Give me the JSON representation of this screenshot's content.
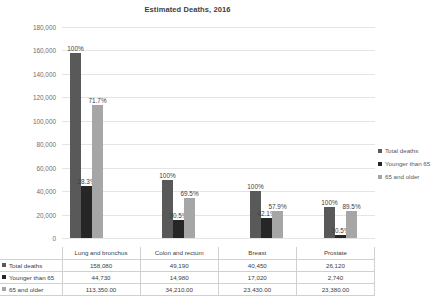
{
  "chart_data": {
    "type": "bar",
    "title": "Estimated Deaths, 2016",
    "xlabel": "",
    "ylabel": "",
    "ylim": [
      0,
      180000
    ],
    "ytick_step": 20000,
    "grid": true,
    "legend_position": "right",
    "categories": [
      "Lung and bronchus",
      "Colon and rectum",
      "Breast",
      "Prostate"
    ],
    "ytick_labels": [
      "0",
      "20,000",
      "40,000",
      "60,000",
      "80,000",
      "100,000",
      "120,000",
      "140,000",
      "160,000",
      "180,000"
    ],
    "ytick_values": [
      0,
      20000,
      40000,
      60000,
      80000,
      100000,
      120000,
      140000,
      160000,
      180000
    ],
    "series": [
      {
        "name": "Total deaths",
        "color": "#595959",
        "values": [
          158080,
          49190,
          40450,
          26120
        ],
        "display_values": [
          "158,080",
          "49,190",
          "40,450",
          "26,120"
        ],
        "point_labels": [
          "100%",
          "100%",
          "100%",
          "100%"
        ]
      },
      {
        "name": "Younger than 65",
        "color": "#262626",
        "values": [
          44730,
          14980,
          17020,
          2740
        ],
        "display_values": [
          "44,730",
          "14,980",
          "17,020",
          "2,740"
        ],
        "point_labels": [
          "28.3%",
          "30.5%",
          "42.1%",
          "10.5%"
        ]
      },
      {
        "name": "65 and older",
        "color": "#a6a6a6",
        "values": [
          113350,
          34210,
          23430,
          23380
        ],
        "display_values": [
          "113,350.00",
          "34,210.00",
          "23,430.00",
          "23,380.00"
        ],
        "point_labels": [
          "71.7%",
          "69.5%",
          "57.9%",
          "89.5%"
        ]
      }
    ]
  }
}
